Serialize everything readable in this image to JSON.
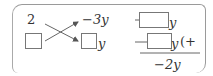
{
  "diagram": {
    "type": "cross-multiplication-factoring",
    "left_column": {
      "top": "2",
      "bottom": "blank"
    },
    "middle_column": {
      "top": "−3y",
      "bottom_suffix": "y"
    },
    "right_column": {
      "top_suffix": "y",
      "bottom_suffix": "y",
      "bottom_tail": "(+",
      "sum": "−2y"
    },
    "colors": {
      "stroke": "#777777",
      "text": "#333333"
    }
  }
}
